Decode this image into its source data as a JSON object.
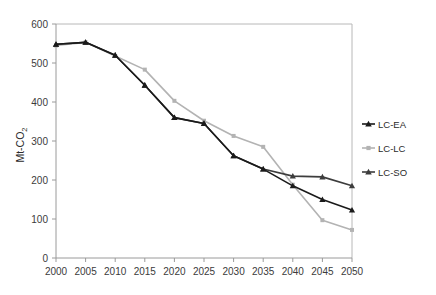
{
  "chart_data": {
    "type": "line",
    "title": "",
    "xlabel": "",
    "ylabel": "Mt-CO2",
    "ylabel_display": "Mt-CO",
    "ylabel_subscript": "2",
    "categories": [
      "2000",
      "2005",
      "2010",
      "2015",
      "2020",
      "2025",
      "2030",
      "2035",
      "2040",
      "2045",
      "2050"
    ],
    "x": [
      2000,
      2005,
      2010,
      2015,
      2020,
      2025,
      2030,
      2035,
      2040,
      2045,
      2050
    ],
    "xlim": [
      2000,
      2050
    ],
    "ylim": [
      0,
      600
    ],
    "ytick_labels": [
      "0",
      "100",
      "200",
      "300",
      "400",
      "500",
      "600"
    ],
    "yticks": [
      0,
      100,
      200,
      300,
      400,
      500,
      600
    ],
    "grid": false,
    "legend_position": "right",
    "series": [
      {
        "name": "LC-EA",
        "color": "#1a1a1a",
        "marker": "triangle",
        "values": [
          548,
          553,
          520,
          443,
          360,
          345,
          262,
          228,
          185,
          150,
          123
        ]
      },
      {
        "name": "LC-LC",
        "color": "#b3b3b3",
        "marker": "square",
        "values": [
          545,
          553,
          518,
          483,
          403,
          352,
          313,
          285,
          188,
          97,
          72
        ]
      },
      {
        "name": "LC-SO",
        "color": "#3d3d3d",
        "marker": "triangle",
        "values": [
          548,
          553,
          520,
          443,
          360,
          345,
          262,
          228,
          210,
          208,
          185
        ]
      }
    ]
  },
  "legend": {
    "items": [
      {
        "label": "LC-EA"
      },
      {
        "label": "LC-LC"
      },
      {
        "label": "LC-SO"
      }
    ]
  },
  "colors": {
    "series_lc_ea": "#1a1a1a",
    "series_lc_lc": "#b3b3b3",
    "series_lc_so": "#3d3d3d",
    "axis": "#9a9a9a",
    "text": "#3b3b3b",
    "background": "#ffffff"
  }
}
